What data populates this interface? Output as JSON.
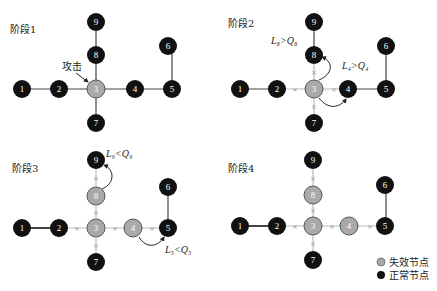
{
  "colors": {
    "normal": "#111111",
    "failed": "#a9a9a9",
    "edge": "#444444",
    "cut_edge": "#bbbbbb"
  },
  "panels": [
    {
      "title": "阶段1",
      "failed": [
        "3"
      ],
      "annotations": [
        {
          "text": "攻击"
        }
      ],
      "conditions": []
    },
    {
      "title": "阶段2",
      "failed": [
        "3"
      ],
      "conditions": [
        {
          "text": "L₈>Q₈"
        },
        {
          "text": "L₄>Q₄"
        }
      ]
    },
    {
      "title": "阶段3",
      "failed": [
        "3",
        "4",
        "8"
      ],
      "conditions": [
        {
          "text": "L₉<Q₉"
        },
        {
          "text": "L₅<Q₅"
        }
      ]
    },
    {
      "title": "阶段4",
      "failed": [
        "3",
        "4",
        "8"
      ],
      "conditions": []
    }
  ],
  "nodes": [
    "1",
    "2",
    "3",
    "4",
    "5",
    "6",
    "7",
    "8",
    "9"
  ],
  "legend": {
    "failed_label": "失效节点",
    "normal_label": "正常节点"
  }
}
